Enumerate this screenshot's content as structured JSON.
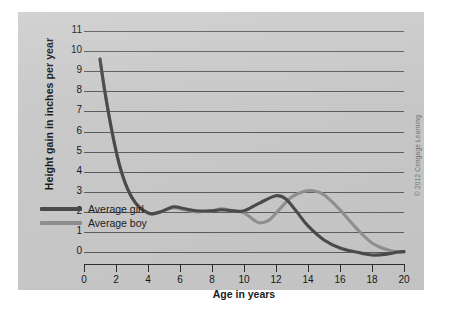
{
  "chart_data": {
    "type": "line",
    "title": "",
    "xlabel": "Age in years",
    "ylabel": "Height gain in inches per year",
    "xlim": [
      0,
      20
    ],
    "ylim": [
      0,
      11
    ],
    "grid": true,
    "legend_position": "inside-lower-left",
    "xticks": [
      0,
      2,
      4,
      6,
      8,
      10,
      12,
      14,
      16,
      18,
      20
    ],
    "yticks": [
      0,
      1,
      2,
      3,
      4,
      5,
      6,
      7,
      8,
      9,
      10,
      11
    ],
    "series": [
      {
        "name": "Average girl",
        "color": "#4a4a4a",
        "x": [
          1.0,
          1.3,
          1.7,
          2.1,
          2.5,
          3.0,
          3.5,
          4.0,
          4.3,
          4.8,
          5.6,
          6.3,
          7.0,
          8.0,
          8.6,
          9.3,
          10.0,
          11.0,
          12.0,
          12.6,
          13.3,
          14.0,
          15.0,
          16.0,
          17.0,
          18.0,
          19.0,
          19.6,
          20.0
        ],
        "y": [
          9.6,
          8.0,
          6.2,
          4.7,
          3.6,
          2.7,
          2.2,
          1.95,
          1.9,
          2.0,
          2.25,
          2.15,
          2.05,
          2.05,
          2.1,
          2.05,
          2.05,
          2.45,
          2.8,
          2.65,
          2.0,
          1.3,
          0.6,
          0.2,
          0.0,
          -0.15,
          -0.1,
          0.0,
          0.02
        ]
      },
      {
        "name": "Average boy",
        "color": "#8e8e8e",
        "x": [
          1.0,
          1.3,
          1.7,
          2.1,
          2.5,
          3.0,
          3.5,
          4.0,
          4.3,
          4.8,
          5.6,
          6.3,
          7.0,
          8.0,
          8.6,
          9.3,
          10.0,
          10.6,
          11.0,
          11.6,
          12.3,
          13.0,
          13.7,
          14.3,
          15.0,
          16.0,
          17.0,
          18.0,
          19.0,
          19.6,
          20.0
        ],
        "y": [
          9.6,
          8.0,
          6.2,
          4.7,
          3.6,
          2.7,
          2.2,
          1.95,
          1.9,
          2.0,
          2.2,
          2.1,
          2.0,
          2.05,
          2.15,
          2.05,
          1.95,
          1.6,
          1.45,
          1.6,
          2.2,
          2.75,
          3.0,
          3.05,
          2.85,
          2.1,
          1.2,
          0.45,
          0.1,
          0.0,
          0.0
        ]
      }
    ]
  },
  "axes": {
    "y_title": "Height gain in inches per year",
    "x_title": "Age in years",
    "y_tick_labels": [
      "11",
      "10",
      "9",
      "8",
      "7",
      "6",
      "5",
      "4",
      "3",
      "2",
      "1",
      "0"
    ],
    "x_tick_labels": [
      "0",
      "2",
      "4",
      "6",
      "8",
      "10",
      "12",
      "14",
      "16",
      "18",
      "20"
    ]
  },
  "legend": {
    "items": [
      {
        "label": "Average girl",
        "color": "#4a4a4a"
      },
      {
        "label": "Average boy",
        "color": "#8e8e8e"
      }
    ]
  },
  "credit": {
    "text": "© 2012 Cengage Learning"
  },
  "colors": {
    "panel_background": "#c8c8c8",
    "gridline": "#5c5c5c",
    "axis": "#2e2e2e",
    "text": "#161616",
    "girl_line": "#4a4a4a",
    "boy_line": "#8e8e8e"
  }
}
